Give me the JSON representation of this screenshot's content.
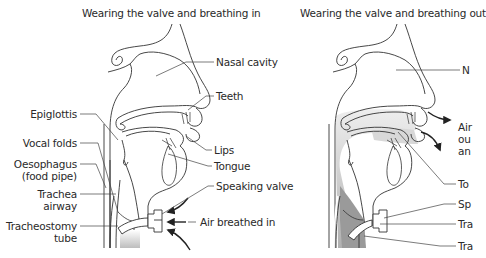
{
  "panels": [
    {
      "title": "Wearing the valve and breathing in",
      "labels": {
        "nasal_cavity": "Nasal cavity",
        "teeth": "Teeth",
        "lips": "Lips",
        "tongue": "Tongue",
        "speaking_valve": "Speaking valve",
        "air": "Air breathed in",
        "epiglottis": "Epiglottis",
        "vocal_folds": "Vocal folds",
        "oesophagus_1": "Oesophagus",
        "oesophagus_2": "(food pipe)",
        "trachea_1": "Trachea",
        "trachea_2": "airway",
        "tube_1": "Tracheostomy",
        "tube_2": "tube"
      }
    },
    {
      "title": "Wearing the valve and breathing out",
      "labels": {
        "nasal_cavity": "N",
        "air_1": "Air",
        "air_2": "ou",
        "air_3": "an",
        "tongue": "To",
        "speaking_valve": "Sp",
        "trachea": "Tra",
        "tube": "Tra"
      }
    }
  ],
  "colors": {
    "line": "#333333",
    "text": "#2a2a2a",
    "shade_dark": "#9a9a9a",
    "shade_light": "#d8d8d8"
  }
}
